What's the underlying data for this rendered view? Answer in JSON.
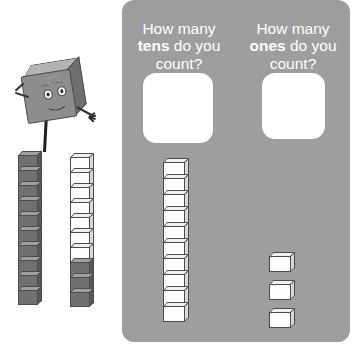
{
  "worksheet": {
    "background_color": "#ffffff",
    "panel": {
      "color": "#9e9e9e",
      "questions": [
        {
          "id": "tens-question",
          "prefix": "How many ",
          "keyword": "tens",
          "suffix": " do you count?",
          "full_text": "How many tens do you count?",
          "answer_box_value": "",
          "answer_box_placeholder": ""
        },
        {
          "id": "ones-question",
          "prefix": "How many ",
          "keyword": "ones",
          "suffix": " do you count?",
          "full_text": "How many ones do you count?",
          "answer_box_value": "",
          "answer_box_placeholder": ""
        }
      ],
      "manipulatives": {
        "tens_rod_label": "ten-rod",
        "tens_rod_cube_count": 10,
        "ones_label": "single-ones-cubes",
        "ones_cube_count": 3
      }
    },
    "illustration": {
      "mascot": {
        "name": "cube-mascot",
        "expression": "smiling"
      },
      "towers": [
        {
          "id": "tower-dark",
          "total_cubes": 10,
          "dark_cubes": 10,
          "light_cubes": 0,
          "color_dark": "#707070",
          "color_light": "#fdfdfd"
        },
        {
          "id": "tower-mixed",
          "total_cubes": 10,
          "dark_cubes": 3,
          "light_cubes": 7,
          "color_dark": "#707070",
          "color_light": "#fdfdfd"
        }
      ]
    }
  },
  "chart_data": {
    "type": "bar",
    "categories": [
      "tens-rod",
      "ones-cubes"
    ],
    "values": [
      10,
      3
    ],
    "xlabel": "",
    "ylabel": "cube count",
    "ylim": [
      0,
      10
    ]
  }
}
